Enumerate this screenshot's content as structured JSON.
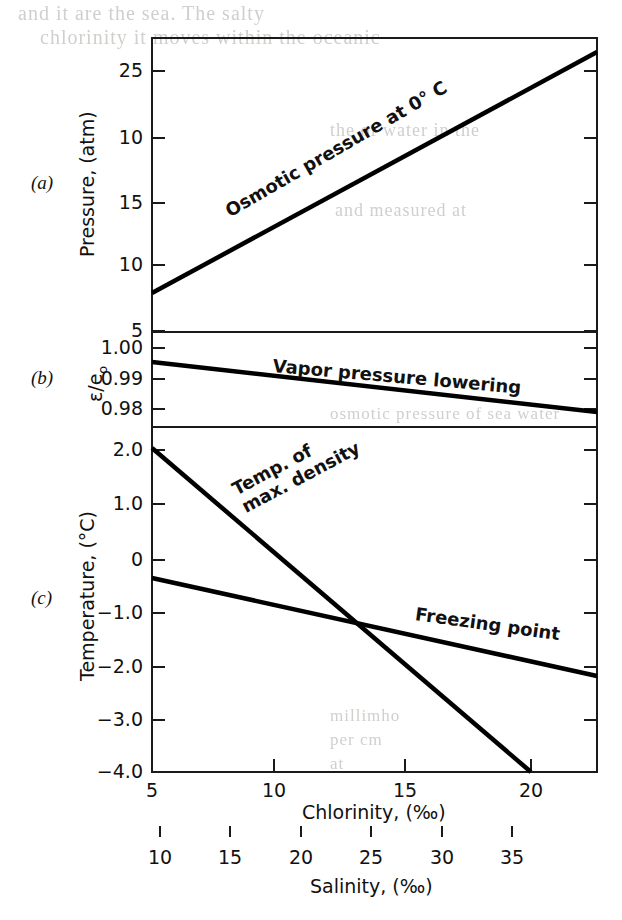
{
  "figure": {
    "background": "#ffffff",
    "ink": "#000000",
    "plot_left_px": 152,
    "plot_right_px": 597
  },
  "bleed_through": [
    {
      "text": "and   it   are   the   sea.   The   salty",
      "x": 18,
      "y": 2,
      "size": 20
    },
    {
      "text": "chlorinity   it   moves   within   the   oceanic",
      "x": 40,
      "y": 26,
      "size": 20
    },
    {
      "text": "the   of   water   in   the",
      "x": 330,
      "y": 120,
      "size": 18
    },
    {
      "text": "and   measured   at",
      "x": 335,
      "y": 200,
      "size": 18
    },
    {
      "text": "osmotic   pressure   of   sea   water",
      "x": 330,
      "y": 404,
      "size": 17
    },
    {
      "text": "millimho",
      "x": 330,
      "y": 706,
      "size": 17
    },
    {
      "text": "per   cm",
      "x": 330,
      "y": 730,
      "size": 17
    },
    {
      "text": "at",
      "x": 330,
      "y": 754,
      "size": 17
    }
  ],
  "panels": [
    {
      "id": "a",
      "id_label": "(a)",
      "axis_title": "Pressure, (atm)",
      "y_ticks": [
        {
          "label": "25",
          "y_px": 71
        },
        {
          "label": "10",
          "y_px": 138
        },
        {
          "label": "15",
          "y_px": 203
        },
        {
          "label": "10",
          "y_px": 265
        },
        {
          "label": "5",
          "y_px": 331
        }
      ],
      "top_px": 38,
      "bottom_px": 332,
      "curves": [
        {
          "name": "osmotic-pressure",
          "label": "Osmotic pressure at 0° C",
          "label_rotation_deg": -30,
          "label_x_px": 232,
          "label_y_px": 211,
          "x1_px": 152,
          "y1_px": 293,
          "x2_px": 597,
          "y2_px": 52
        }
      ]
    },
    {
      "id": "b",
      "id_label": "(b)",
      "axis_title": "ε/e",
      "axis_title_sub": "o",
      "y_ticks": [
        {
          "label": "1.00",
          "y_px": 348
        },
        {
          "label": "0.99",
          "y_px": 379
        },
        {
          "label": "0.98",
          "y_px": 409
        }
      ],
      "top_px": 332,
      "bottom_px": 427,
      "curves": [
        {
          "name": "vapor-pressure-lowering",
          "label": "Vapor pressure lowering",
          "label_rotation_deg": 5,
          "label_x_px": 272,
          "label_y_px": 366,
          "x1_px": 152,
          "y1_px": 362,
          "x2_px": 597,
          "y2_px": 412
        }
      ]
    },
    {
      "id": "c",
      "id_label": "(c)",
      "axis_title": "Temperature, (°C)",
      "y_ticks": [
        {
          "label": "2.0",
          "y_px": 450
        },
        {
          "label": "1.0",
          "y_px": 504
        },
        {
          "label": "0",
          "y_px": 560
        },
        {
          "label": "−1.0",
          "y_px": 613
        },
        {
          "label": "−2.0",
          "y_px": 667
        },
        {
          "label": "−3.0",
          "y_px": 720
        },
        {
          "label": "−4.0",
          "y_px": 772
        }
      ],
      "top_px": 427,
      "bottom_px": 772,
      "curves": [
        {
          "name": "temp-max-density",
          "label_line1": "Temp. of",
          "label_line2": "max. density",
          "label_rotation_deg": -28,
          "label_x_px": 248,
          "label_y_px": 497,
          "x1_px": 152,
          "y1_px": 448,
          "x2_px": 531,
          "y2_px": 772
        },
        {
          "name": "freezing-point",
          "label": "Freezing point",
          "label_rotation_deg": 8,
          "label_x_px": 414,
          "label_y_px": 614,
          "x1_px": 152,
          "y1_px": 578,
          "x2_px": 597,
          "y2_px": 676
        }
      ]
    }
  ],
  "x_axes": [
    {
      "name": "chlorinity",
      "title": "Chlorinity, (‰)",
      "title_x_px": 302,
      "title_y_px": 801,
      "axis_y_px": 772,
      "ticks": [
        {
          "label": "5",
          "x_px": 152
        },
        {
          "label": "10",
          "x_px": 274
        },
        {
          "label": "15",
          "x_px": 405
        },
        {
          "label": "20",
          "x_px": 531
        }
      ],
      "tick_label_y_px": 779
    },
    {
      "name": "salinity",
      "title": "Salinity, (‰)",
      "title_x_px": 310,
      "title_y_px": 875,
      "axis_y_px": 836,
      "ticks": [
        {
          "label": "10",
          "x_px": 160
        },
        {
          "label": "15",
          "x_px": 230
        },
        {
          "label": "20",
          "x_px": 301
        },
        {
          "label": "25",
          "x_px": 371
        },
        {
          "label": "30",
          "x_px": 442
        },
        {
          "label": "35",
          "x_px": 512
        }
      ],
      "tick_label_y_px": 846
    }
  ],
  "chart_data": {
    "type": "line",
    "title": "",
    "xlabel": "Chlorinity, (‰)",
    "xlabel_secondary": "Salinity, (‰)",
    "x": [
      5,
      10,
      15,
      20
    ],
    "xlim": [
      5,
      22.3
    ],
    "x_secondary": [
      10,
      15,
      20,
      25,
      30,
      35
    ],
    "grid": false,
    "legend": "inline-labels",
    "panels": [
      {
        "panel": "a",
        "ylabel": "Pressure, (atm)",
        "ytick_labels": [
          "25",
          "10",
          "15",
          "10",
          "5"
        ],
        "ytick_values": [
          25,
          20,
          15,
          10,
          5
        ],
        "ylim": [
          5,
          27.5
        ],
        "series": [
          {
            "name": "Osmotic pressure at 0° C",
            "x": [
              5,
              10,
              15,
              20,
              22.3
            ],
            "values": [
              8.0,
              13.0,
              18.1,
              23.1,
              25.4
            ]
          }
        ]
      },
      {
        "panel": "b",
        "ylabel": "ε/eₒ",
        "ytick_labels": [
          "1.00",
          "0.99",
          "0.98"
        ],
        "ytick_values": [
          1.0,
          0.99,
          0.98
        ],
        "ylim": [
          0.9755,
          1.0055
        ],
        "series": [
          {
            "name": "Vapor pressure lowering",
            "x": [
              5,
              10,
              15,
              20,
              22.3
            ],
            "values": [
              0.9955,
              0.9917,
              0.988,
              0.9843,
              0.9825
            ]
          }
        ]
      },
      {
        "panel": "c",
        "ylabel": "Temperature, (°C)",
        "ytick_labels": [
          "2.0",
          "1.0",
          "0",
          "−1.0",
          "−2.0",
          "−3.0",
          "−4.0"
        ],
        "ytick_values": [
          2.0,
          1.0,
          0.0,
          -1.0,
          -2.0,
          -3.0,
          -4.0
        ],
        "ylim": [
          -4.0,
          2.4
        ],
        "series": [
          {
            "name": "Temp. of max. density",
            "x": [
              5,
              10,
              15,
              20.8
            ],
            "values": [
              2.05,
              0.4,
              -1.35,
              -4.0
            ]
          },
          {
            "name": "Freezing point",
            "x": [
              5,
              10,
              15,
              20,
              22.3
            ],
            "values": [
              -0.28,
              -0.78,
              -1.32,
              -1.86,
              -2.1
            ]
          }
        ]
      }
    ]
  }
}
